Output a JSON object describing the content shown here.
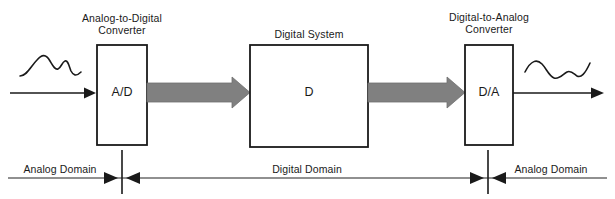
{
  "diagram": {
    "colors": {
      "stroke": "#1a1a1a",
      "thick_arrow_fill": "#808080",
      "thick_arrow_stroke": "#6e6e6e",
      "domain_line": "#6b6b6b",
      "background": "#ffffff"
    },
    "blocks": [
      {
        "id": "adc",
        "caption_line1": "Analog-to-Digital",
        "caption_line2": "Converter",
        "inner_label": "A/D"
      },
      {
        "id": "digital-system",
        "caption_line1": "Digital System",
        "caption_line2": "",
        "inner_label": "D"
      },
      {
        "id": "dac",
        "caption_line1": "Digital-to-Analog",
        "caption_line2": "Converter",
        "inner_label": "D/A"
      }
    ],
    "domains": [
      {
        "id": "analog-left",
        "label": "Analog Domain"
      },
      {
        "id": "digital",
        "label": "Digital Domain"
      },
      {
        "id": "analog-right",
        "label": "Analog Domain"
      }
    ],
    "signals": [
      {
        "id": "input-waveform",
        "kind": "analog-waveform-icon"
      },
      {
        "id": "output-waveform",
        "kind": "analog-waveform-icon"
      },
      {
        "id": "input-arrow",
        "kind": "thin-arrow-right"
      },
      {
        "id": "output-arrow",
        "kind": "thin-arrow-right"
      },
      {
        "id": "adc-to-digital-arrow",
        "kind": "thick-gray-arrow-right"
      },
      {
        "id": "digital-to-dac-arrow",
        "kind": "thick-gray-arrow-right"
      }
    ]
  }
}
